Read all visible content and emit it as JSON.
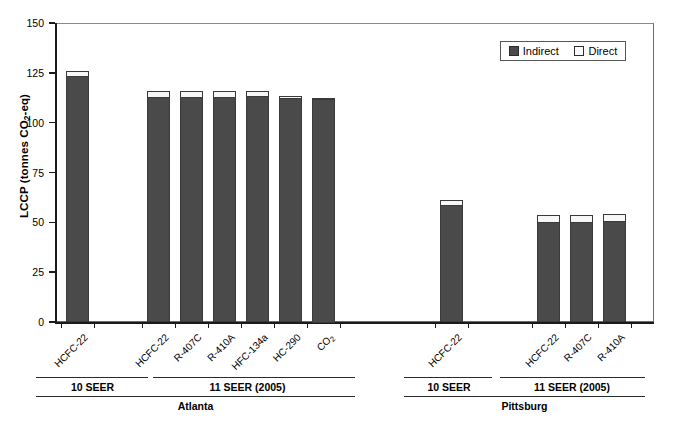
{
  "chart_data": {
    "type": "bar",
    "stacked": true,
    "title": "",
    "xlabel": "",
    "ylabel": "LCCP (tonnes CO2-eq)",
    "ylim": [
      0,
      150
    ],
    "ytick_labels": [
      "0",
      "25",
      "50",
      "75",
      "100",
      "125",
      "150"
    ],
    "ytick_values": [
      0,
      25,
      50,
      75,
      100,
      125,
      150
    ],
    "grid": false,
    "legend": {
      "position": "top-right",
      "entries": [
        {
          "name": "Indirect",
          "color": "#4a4a4a"
        },
        {
          "name": "Direct",
          "color": "#ffffff"
        }
      ]
    },
    "categories": [
      "HCFC-22",
      "HCFC-22",
      "R-407C",
      "R-410A",
      "HFC-134a",
      "HC-290",
      "CO2",
      "HCFC-22",
      "HCFC-22",
      "R-407C",
      "R-410A"
    ],
    "category_labels_html": [
      "HCFC-22",
      "HCFC-22",
      "R-407C",
      "R-410A",
      "HFC-134a",
      "HC-290",
      "CO<sub>2</sub>",
      "HCFC-22",
      "HCFC-22",
      "R-407C",
      "R-410A"
    ],
    "series": [
      {
        "name": "Indirect",
        "values": [
          123.4,
          113.0,
          113.0,
          113.0,
          113.2,
          112.5,
          112.3,
          58.7,
          50.3,
          50.3,
          50.8
        ]
      },
      {
        "name": "Direct",
        "values": [
          2.6,
          3.0,
          2.9,
          2.9,
          2.8,
          0.9,
          0.2,
          2.3,
          3.5,
          3.5,
          3.4
        ]
      }
    ],
    "totals": [
      126.0,
      116.0,
      115.9,
      115.9,
      116.0,
      113.4,
      112.5,
      61.0,
      53.8,
      53.8,
      54.2
    ],
    "groups": [
      {
        "city": "Atlanta",
        "subgroups": [
          {
            "label": "10 SEER",
            "categories": [
              "HCFC-22"
            ]
          },
          {
            "label": "11 SEER (2005)",
            "categories": [
              "HCFC-22",
              "R-407C",
              "R-410A",
              "HFC-134a",
              "HC-290",
              "CO2"
            ]
          }
        ]
      },
      {
        "city": "Pittsburg",
        "subgroups": [
          {
            "label": "10 SEER",
            "categories": [
              "HCFC-22"
            ]
          },
          {
            "label": "11 SEER (2005)",
            "categories": [
              "HCFC-22",
              "R-407C",
              "R-410A"
            ]
          }
        ]
      }
    ]
  },
  "axis": {
    "y_title_main": "LCCP (tonnes CO",
    "y_title_sub": "2",
    "y_title_tail": "-eq)"
  },
  "group_labels": {
    "atlanta_10seer": "10 SEER",
    "atlanta_11seer": "11 SEER (2005)",
    "atlanta_city": "Atlanta",
    "pittsburg_10seer": "10 SEER",
    "pittsburg_11seer": "11 SEER (2005)",
    "pittsburg_city": "Pittsburg"
  }
}
